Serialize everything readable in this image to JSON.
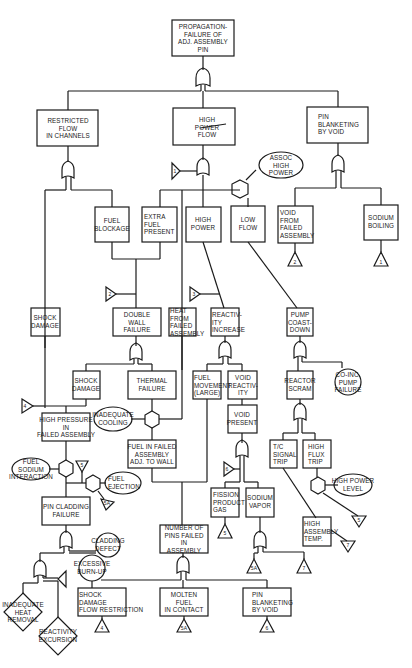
{
  "diagram": {
    "type": "fault-tree",
    "line_color": "#1a1a1a",
    "background": "#ffffff",
    "events": {
      "top": "PROPAGATION-\nFAILURE OF\nADJ. ASSEMBLY\nPIN",
      "restricted_flow": "RESTRICTED\nFLOW\nIN CHANNELS",
      "high_power_flow": "HIGH\nPOWER\nFLOW",
      "pin_blanketing_top": "PIN\nBLANKETING\nBY VOID",
      "assoc_high_power": "ASSOC\nHIGH\nPOWER",
      "fuel_blockage": "FUEL\nBLOCKAGE",
      "extra_fuel_present": "EXTRA\nFUEL\nPRESENT",
      "high_power": "HIGH\nPOWER",
      "low_flow": "LOW\nFLOW",
      "void_from_failed": "VOID\nFROM\nFAILED\nASSEMBLY",
      "sodium_boiling": "SODIUM\nBOILING",
      "shock_damage_left": "SHOCK\nDAMAGE",
      "double_wall_failure": "DOUBLE\nWALL\nFAILURE",
      "heat_from_failed": "HEAT\nFROM\nFAILED\nASSEMBLY",
      "reactivity_increase": "REACTIV-\nITY\nINCREASE",
      "pump_coastdown": "PUMP\nCOAST-\nDOWN",
      "shock_damage_mid": "SHOCK\nDAMAGE",
      "thermal_failure": "THERMAL\nFAILURE",
      "fuel_movement": "FUEL\nMOVEMENT\n(LARGE)",
      "void_reactivity": "VOID\nREACTIV-\nITY",
      "reactor_scram": "REACTOR\nSCRAM",
      "coinc_pump_failure": "CO-INC.\nPUMP\nFAILURE",
      "high_pressure": "HIGH PRESSURE\nIN\nFAILED ASSEMBLY",
      "inadequate_cooling": "INADEQUATE\nCOOLING",
      "void_present": "VOID\nPRESENT",
      "fuel_in_failed": "FUEL IN FAILED\nASSEMBLY\nADJ. TO WALL",
      "tc_signal_trip": "T/C\nSIGNAL\nTRIP",
      "high_flux_trip": "HIGH\nFLUX\nTRIP",
      "fuel_sodium_interaction": "FUEL\nSODIUM\nINTERACTION",
      "fuel_ejection": "FUEL\nEJECTION",
      "high_power_level": "HIGH POWER\nLEVEL",
      "fission_product_gas": "FISSION\nPRODUCT\nGAS",
      "sodium_vapor": "SODIUM\nVAPOR",
      "pin_cladding_failure": "PIN CLADDING\nFAILURE",
      "high_assembly_temp": "HIGH\nASSEMBLY\nTEMP.",
      "cladding_defect": "CLADDING\nDEFECT",
      "number_of_pins": "NUMBER OF\nPINS FAILED\nIN\nASSEMBLY",
      "excessive_burnup": "EXCESSIVE\nBURN-UP",
      "inadequate_heat_removal": "INADEQUATE\nHEAT\nREMOVAL",
      "reactivity_excursion": "REACTIVITY\nEXCURSION",
      "shock_damage_flow": "SHOCK\nDAMAGE\nFLOW RESTRICTION",
      "molten_fuel": "MOLTEN\nFUEL\nIN CONTACT",
      "pin_blanketing_bottom": "PIN\nBLANKETING\nBY VOID"
    },
    "transfers": {
      "t_hp": "1",
      "t_void_from": "2",
      "t_sodium": "1",
      "t_fuel_blk": "2",
      "t_hp3": "3",
      "t_hpress": "4",
      "t_fsi": "5",
      "t_eject": "5A",
      "t_voidpres": "6",
      "t_fpg": "5",
      "t_nv1": "5A",
      "t_nv2": "7",
      "t_hpl": "5",
      "t_hat": "7",
      "t_sdfr": "4",
      "t_mf": "5A",
      "t_pb": "6"
    }
  }
}
